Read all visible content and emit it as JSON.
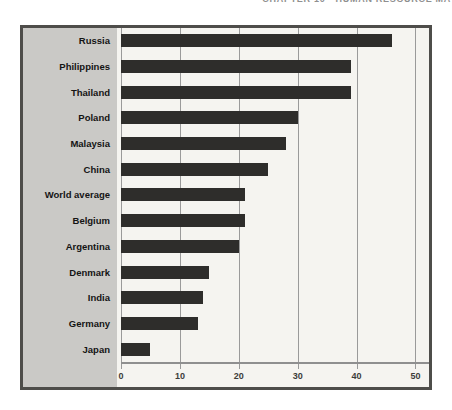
{
  "page": {
    "header_clipped": "CHAPTER 10 • HUMAN RESOURCE MA"
  },
  "chart_data": {
    "type": "bar",
    "orientation": "horizontal",
    "title": "",
    "xlabel": "",
    "ylabel": "",
    "categories": [
      "Russia",
      "Philippines",
      "Thailand",
      "Poland",
      "Malaysia",
      "China",
      "World average",
      "Belgium",
      "Argentina",
      "Denmark",
      "India",
      "Germany",
      "Japan"
    ],
    "values": [
      46,
      39,
      39,
      30,
      28,
      25,
      21,
      21,
      20,
      15,
      14,
      13,
      5
    ],
    "xticks": [
      0,
      10,
      20,
      30,
      40,
      50
    ],
    "xlim": [
      0,
      52.3
    ],
    "grid": "vertical",
    "legend": "none"
  },
  "colors": {
    "bar": "#2e2d2b",
    "frame_border": "#4e4d4a",
    "label_panel_bg": "#cac9c6",
    "plot_bg": "#f5f4f0",
    "gridline": "#9a9a9a",
    "label_text": "#141414",
    "tick_text": "#3d3c3a",
    "header_text": "#8f8f8f"
  }
}
